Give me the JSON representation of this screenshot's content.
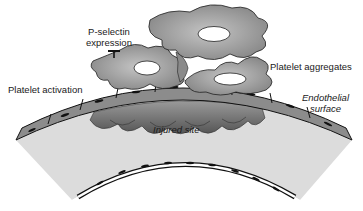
{
  "diagram": {
    "labels": {
      "p_selectin_line1": "P-selectin",
      "p_selectin_line2": "expression",
      "platelet_activation": "Platelet activation",
      "platelet_aggregates": "Platelet aggregates",
      "endothelial_line1": "Endothelial",
      "endothelial_line2": "surface",
      "injured_site": "Injured site"
    },
    "colors": {
      "platelet_fill": "#a9a9a9",
      "platelet_dark": "#7a7a7a",
      "endothelium_fill": "#8c8c8c",
      "wall_fill": "#d9d9d9",
      "adherent_platelets": "#6e6e6e",
      "outline": "#1a1a1a"
    }
  }
}
